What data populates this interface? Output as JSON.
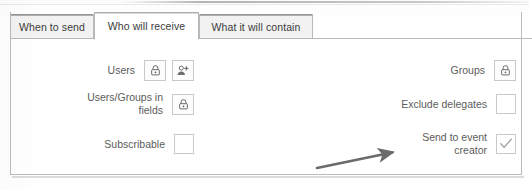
{
  "panel": {
    "tabs": [
      {
        "label": "When to send",
        "active": false
      },
      {
        "label": "Who will receive",
        "active": true
      },
      {
        "label": "What it will contain",
        "active": false
      }
    ],
    "left_column": [
      {
        "label": "Users",
        "controls": [
          {
            "type": "icon-button",
            "icon": "lock-icon"
          },
          {
            "type": "icon-button",
            "icon": "add-user-icon"
          }
        ]
      },
      {
        "label": "Users/Groups in\nfields",
        "controls": [
          {
            "type": "icon-button",
            "icon": "lock-icon"
          }
        ]
      },
      {
        "label": "Subscribable",
        "controls": [
          {
            "type": "checkbox",
            "checked": false
          }
        ]
      }
    ],
    "right_column": [
      {
        "label": "Groups",
        "controls": [
          {
            "type": "icon-button",
            "icon": "lock-icon"
          }
        ]
      },
      {
        "label": "Exclude delegates",
        "controls": [
          {
            "type": "checkbox",
            "checked": false
          }
        ]
      },
      {
        "label": "Send to event\ncreator",
        "controls": [
          {
            "type": "checkbox",
            "checked": true
          }
        ]
      }
    ]
  },
  "annotation": {
    "type": "arrow",
    "points_to": "Send to event creator",
    "color": "#6b6b6b"
  },
  "colors": {
    "panel_border": "#bcbcbc",
    "tab_inactive_bg": "#f2f2f2",
    "tab_active_bg": "#ffffff",
    "label_text": "#5c5c5c",
    "control_border": "#c9c9c9",
    "check_mark": "#9a9a9a"
  }
}
